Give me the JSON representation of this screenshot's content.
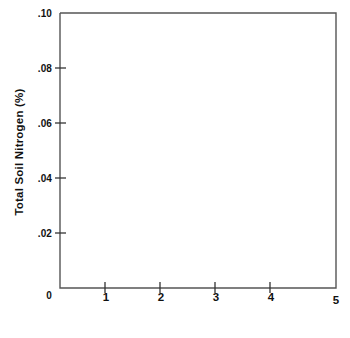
{
  "chart_data": {
    "type": "line",
    "title": "",
    "subtitle": "",
    "xlabel": "Soil Depth",
    "xlabel_unit": "(inches)",
    "xlabel_full": "Soil Depth (inches)",
    "ylabel": "Total Soil Nitrogen (%)",
    "xlim": [
      0,
      5
    ],
    "ylim": [
      0,
      0.1
    ],
    "grid": false,
    "legend": null,
    "legend_position": "none",
    "frame": "box",
    "line_color": "#1a1a1a",
    "axis_color": "#4d4d4d",
    "xticks": [
      0,
      1,
      2,
      3,
      4,
      5
    ],
    "xtick_labels": [
      "0",
      "1",
      "2",
      "3",
      "4",
      "5"
    ],
    "yticks": [
      0,
      0.02,
      0.04,
      0.06,
      0.08,
      0.1
    ],
    "ytick_labels": [
      "0",
      ".02",
      ".04",
      ".06",
      ".08",
      ".10"
    ],
    "series": [
      {
        "name": "Total Soil Nitrogen",
        "x": [
          0.0,
          0.25,
          0.5,
          0.75,
          1.0,
          1.25,
          1.5,
          1.75,
          2.0,
          2.25,
          2.5,
          2.75,
          3.0,
          3.25,
          3.5,
          3.75,
          4.0,
          4.25,
          4.5,
          4.75,
          5.0
        ],
        "values": [
          0.1,
          0.0875,
          0.0765,
          0.0668,
          0.0583,
          0.0509,
          0.0444,
          0.0387,
          0.0338,
          0.0295,
          0.0258,
          0.0225,
          0.0196,
          0.0171,
          0.0149,
          0.013,
          0.0114,
          0.0099,
          0.0086,
          0.0075,
          0.0066
        ]
      }
    ],
    "annotations": []
  }
}
